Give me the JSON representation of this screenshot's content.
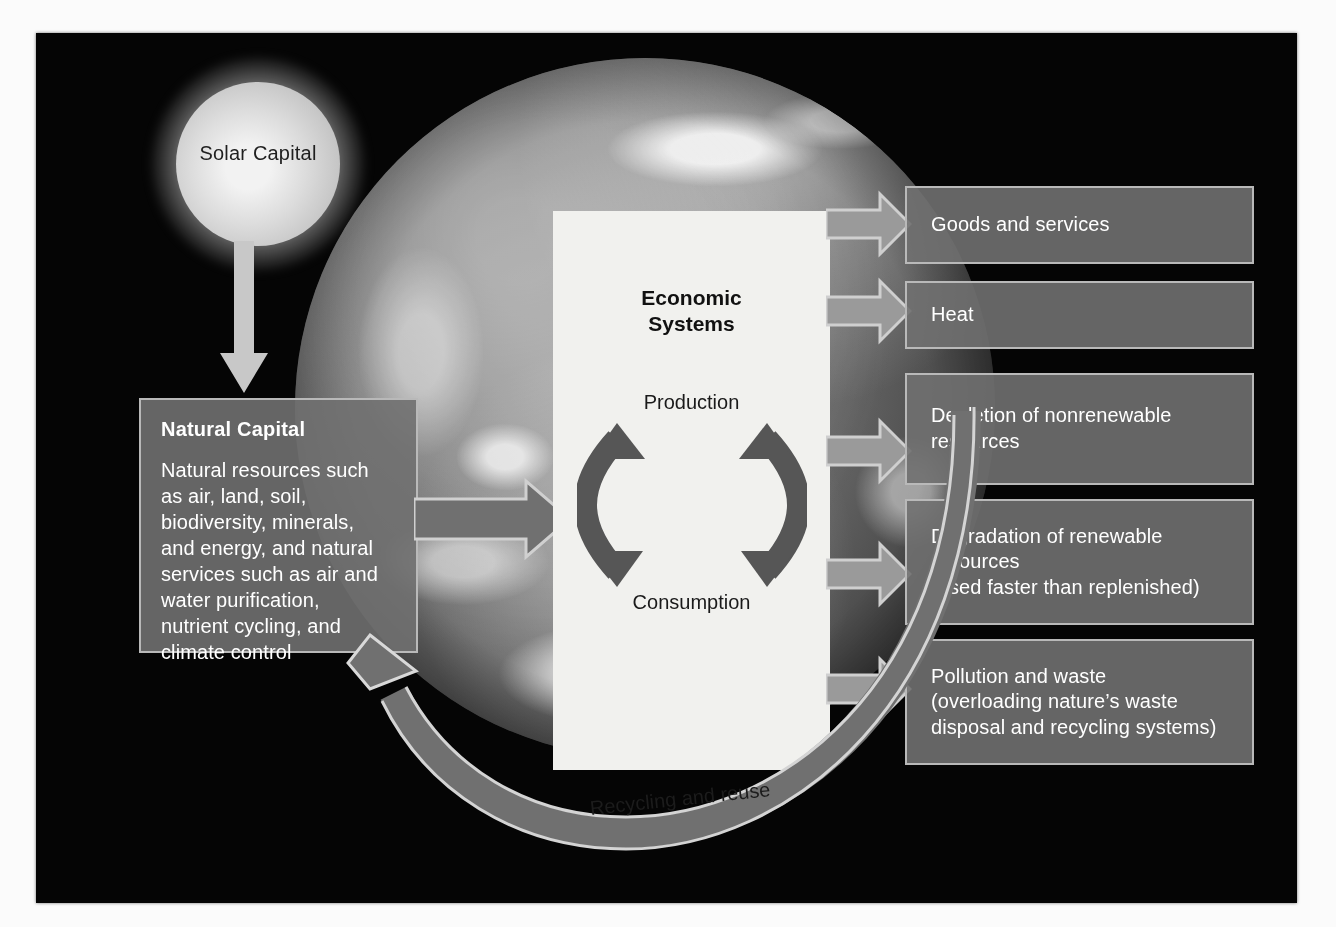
{
  "diagram": {
    "colors": {
      "canvas_background": "#050505",
      "box_fill": "#707070",
      "box_border": "#b9b9b9",
      "panel_fill": "#f1f1ee",
      "arrow_light": "#c8c8c8",
      "arrow_dark": "#565656",
      "text_light": "#ffffff",
      "text_dark": "#1a1a1a"
    }
  },
  "solar": {
    "label": "Solar Capital"
  },
  "natural_capital": {
    "title": "Natural Capital",
    "body": "Natural resources such\nas air, land, soil,\nbiodiversity, minerals,\nand energy, and natural\nservices such as air and\nwater purification,\nnutrient cycling, and\nclimate control"
  },
  "economic_systems": {
    "title": "Economic\nSystems",
    "production_label": "Production",
    "consumption_label": "Consumption"
  },
  "outputs": [
    {
      "id": "goods-and-services",
      "text": "Goods and services"
    },
    {
      "id": "heat",
      "text": "Heat"
    },
    {
      "id": "depletion-nonrenewable",
      "text": "Depletion of nonrenewable\nresources"
    },
    {
      "id": "degradation-renewable",
      "text": "Degradation of renewable\nresources\n(used faster than replenished)"
    },
    {
      "id": "pollution-and-waste",
      "text": "Pollution and waste\n(overloading  nature’s waste\ndisposal  and recycling systems)"
    }
  ],
  "recycling": {
    "label": "Recycling and reuse"
  }
}
